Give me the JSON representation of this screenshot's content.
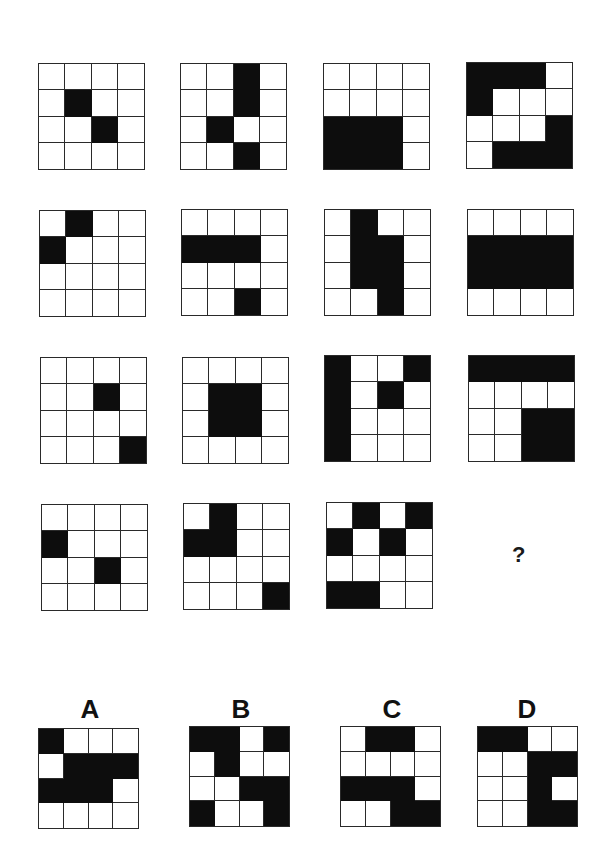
{
  "puzzle": {
    "rows": 4,
    "cols": 4,
    "question_mark": "?",
    "fill_color": "#0d0d0d",
    "line_color": "#2a2a2a",
    "matrix": [
      {
        "id": "r1c1",
        "filled": [
          [
            1,
            1
          ],
          [
            2,
            2
          ]
        ]
      },
      {
        "id": "r1c2",
        "filled": [
          [
            0,
            2
          ],
          [
            1,
            2
          ],
          [
            2,
            1
          ],
          [
            3,
            2
          ]
        ]
      },
      {
        "id": "r1c3",
        "filled": [
          [
            2,
            0
          ],
          [
            2,
            1
          ],
          [
            2,
            2
          ],
          [
            3,
            0
          ],
          [
            3,
            1
          ],
          [
            3,
            2
          ]
        ]
      },
      {
        "id": "r1c4",
        "filled": [
          [
            0,
            0
          ],
          [
            0,
            1
          ],
          [
            0,
            2
          ],
          [
            1,
            0
          ],
          [
            2,
            3
          ],
          [
            3,
            1
          ],
          [
            3,
            2
          ],
          [
            3,
            3
          ]
        ]
      },
      {
        "id": "r2c1",
        "filled": [
          [
            0,
            1
          ],
          [
            1,
            0
          ]
        ]
      },
      {
        "id": "r2c2",
        "filled": [
          [
            1,
            0
          ],
          [
            1,
            1
          ],
          [
            1,
            2
          ],
          [
            3,
            2
          ]
        ]
      },
      {
        "id": "r2c3",
        "filled": [
          [
            0,
            1
          ],
          [
            1,
            1
          ],
          [
            2,
            1
          ],
          [
            1,
            2
          ],
          [
            2,
            2
          ],
          [
            3,
            2
          ]
        ]
      },
      {
        "id": "r2c4",
        "filled": [
          [
            1,
            0
          ],
          [
            1,
            1
          ],
          [
            1,
            2
          ],
          [
            1,
            3
          ],
          [
            2,
            0
          ],
          [
            2,
            1
          ],
          [
            2,
            2
          ],
          [
            2,
            3
          ]
        ]
      },
      {
        "id": "r3c1",
        "filled": [
          [
            1,
            2
          ],
          [
            3,
            3
          ]
        ]
      },
      {
        "id": "r3c2",
        "filled": [
          [
            1,
            1
          ],
          [
            1,
            2
          ],
          [
            2,
            1
          ],
          [
            2,
            2
          ]
        ]
      },
      {
        "id": "r3c3",
        "filled": [
          [
            0,
            0
          ],
          [
            1,
            0
          ],
          [
            2,
            0
          ],
          [
            3,
            0
          ],
          [
            0,
            3
          ],
          [
            1,
            2
          ]
        ]
      },
      {
        "id": "r3c4",
        "filled": [
          [
            0,
            0
          ],
          [
            0,
            1
          ],
          [
            0,
            2
          ],
          [
            0,
            3
          ],
          [
            2,
            2
          ],
          [
            2,
            3
          ],
          [
            3,
            2
          ],
          [
            3,
            3
          ]
        ]
      },
      {
        "id": "r4c1",
        "filled": [
          [
            1,
            0
          ],
          [
            2,
            2
          ]
        ]
      },
      {
        "id": "r4c2",
        "filled": [
          [
            0,
            1
          ],
          [
            1,
            0
          ],
          [
            1,
            1
          ],
          [
            3,
            3
          ]
        ]
      },
      {
        "id": "r4c3",
        "filled": [
          [
            0,
            1
          ],
          [
            0,
            3
          ],
          [
            1,
            0
          ],
          [
            1,
            2
          ],
          [
            3,
            0
          ],
          [
            3,
            1
          ]
        ]
      }
    ],
    "options": [
      {
        "label": "A",
        "filled": [
          [
            0,
            0
          ],
          [
            1,
            1
          ],
          [
            1,
            2
          ],
          [
            1,
            3
          ],
          [
            2,
            0
          ],
          [
            2,
            1
          ],
          [
            2,
            2
          ]
        ]
      },
      {
        "label": "B",
        "filled": [
          [
            0,
            0
          ],
          [
            0,
            1
          ],
          [
            0,
            3
          ],
          [
            1,
            1
          ],
          [
            2,
            2
          ],
          [
            2,
            3
          ],
          [
            3,
            0
          ],
          [
            3,
            3
          ]
        ]
      },
      {
        "label": "C",
        "filled": [
          [
            0,
            1
          ],
          [
            0,
            2
          ],
          [
            2,
            0
          ],
          [
            2,
            1
          ],
          [
            2,
            2
          ],
          [
            3,
            2
          ],
          [
            3,
            3
          ]
        ]
      },
      {
        "label": "D",
        "filled": [
          [
            0,
            0
          ],
          [
            0,
            1
          ],
          [
            1,
            2
          ],
          [
            1,
            3
          ],
          [
            2,
            2
          ],
          [
            3,
            2
          ],
          [
            3,
            3
          ]
        ]
      }
    ]
  }
}
